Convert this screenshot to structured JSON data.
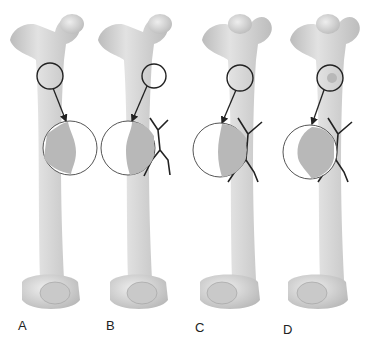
{
  "figure": {
    "panels": [
      {
        "label": "A",
        "x": 12,
        "label_x": 24,
        "label_y": 318,
        "stage": "intact",
        "fracture": false,
        "callus": "small"
      },
      {
        "label": "B",
        "x": 100,
        "label_x": 108,
        "label_y": 318,
        "stage": "fracture",
        "fracture": true,
        "callus": "small"
      },
      {
        "label": "C",
        "x": 188,
        "label_x": 195,
        "label_y": 322,
        "stage": "fracture",
        "fracture": true,
        "callus": "flat"
      },
      {
        "label": "D",
        "x": 276,
        "label_x": 283,
        "label_y": 324,
        "stage": "fracture",
        "fracture": true,
        "callus": "bulge"
      }
    ],
    "colors": {
      "bone": "#d4d4d4",
      "bone_shade": "#bdbdbd",
      "outline": "#333333",
      "fracture": "#222222"
    }
  }
}
